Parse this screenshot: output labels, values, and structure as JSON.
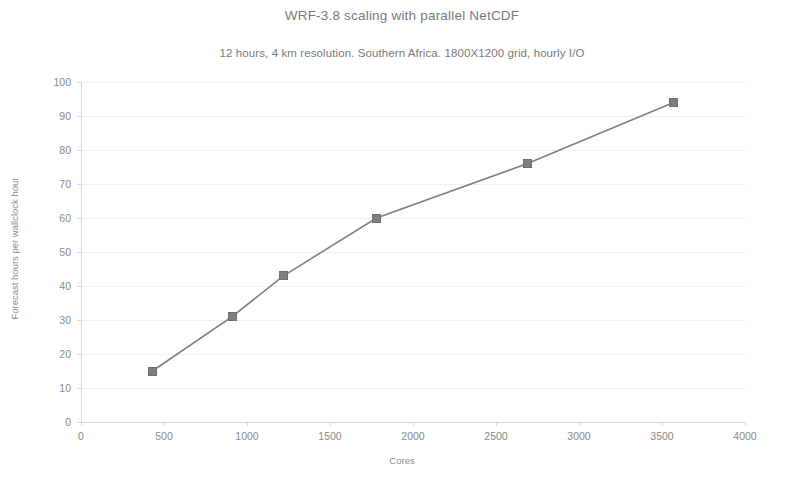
{
  "chart_data": {
    "type": "line",
    "title": "WRF-3.8 scaling with parallel NetCDF",
    "subtitle": "12 hours, 4 km resolution. Southern Africa. 1800X1200 grid, hourly I/O",
    "xlabel": "Cores",
    "ylabel": "Forecast hours per wallclock hour",
    "xlim": [
      0,
      4000
    ],
    "ylim": [
      0,
      100
    ],
    "xticks": [
      0,
      500,
      1000,
      1500,
      2000,
      2500,
      3000,
      3500,
      4000
    ],
    "yticks": [
      0,
      10,
      20,
      30,
      40,
      50,
      60,
      70,
      80,
      90,
      100
    ],
    "grid": true,
    "legend": "none",
    "marker": "square",
    "series_color": "#7f7f7f",
    "series": [
      {
        "name": "WRF-3.8 parallel NetCDF",
        "x": [
          430,
          910,
          1220,
          1780,
          2690,
          3570
        ],
        "y": [
          15,
          31,
          43,
          60,
          76,
          94
        ]
      }
    ]
  }
}
